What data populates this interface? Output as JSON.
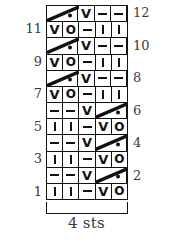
{
  "figure": {
    "kind": "knitting-stitch-chart",
    "stitch_count_caption": "4 sts",
    "columns": 5,
    "rows": 12,
    "ink_color": "#111111",
    "background_color": "#ffffff"
  },
  "row_labels_left": [
    "11",
    "9",
    "7",
    "5",
    "3",
    "1"
  ],
  "row_labels_right": [
    "12",
    "10",
    "8",
    "6",
    "4",
    "2"
  ],
  "symbol_legend": {
    "dash": "purl-stitch-dash",
    "bar": "knit-stitch-bar",
    "v": "slip-stitch-v",
    "o": "yarn-over-circle",
    "diagonal": "travel-line",
    "dot": "bobble-dot"
  },
  "chart_data": {
    "type": "table",
    "title": "",
    "xlabel": "4 sts",
    "ylabel": "",
    "columns": 5,
    "rows": 12,
    "row_order": "bottom-to-top",
    "rows_data": [
      {
        "row": 1,
        "label": "1",
        "label_side": "left",
        "cells": [
          "bar",
          "bar",
          "dash",
          "v",
          "o"
        ]
      },
      {
        "row": 2,
        "label": "2",
        "label_side": "right",
        "cells": [
          "dash",
          "dash",
          "v",
          "diagonal-right-start",
          "diagonal-right-end-dot"
        ]
      },
      {
        "row": 3,
        "label": "3",
        "label_side": "left",
        "cells": [
          "bar",
          "bar",
          "dash",
          "v",
          "o"
        ]
      },
      {
        "row": 4,
        "label": "4",
        "label_side": "right",
        "cells": [
          "dash",
          "dash",
          "v",
          "diagonal-right-start",
          "diagonal-right-end-dot"
        ]
      },
      {
        "row": 5,
        "label": "5",
        "label_side": "left",
        "cells": [
          "bar",
          "bar",
          "dash",
          "v",
          "o"
        ]
      },
      {
        "row": 6,
        "label": "6",
        "label_side": "right",
        "cells": [
          "dash",
          "dash",
          "v",
          "diagonal-right-start",
          "diagonal-right-end-dot"
        ]
      },
      {
        "row": 7,
        "label": "7",
        "label_side": "left",
        "cells": [
          "v",
          "o",
          "dash",
          "bar",
          "bar"
        ]
      },
      {
        "row": 8,
        "label": "8",
        "label_side": "right",
        "cells": [
          "diagonal-left-start",
          "diagonal-left-end-dot",
          "v",
          "dash",
          "dash"
        ]
      },
      {
        "row": 9,
        "label": "9",
        "label_side": "left",
        "cells": [
          "v",
          "o",
          "dash",
          "bar",
          "bar"
        ]
      },
      {
        "row": 10,
        "label": "10",
        "label_side": "right",
        "cells": [
          "diagonal-left-start",
          "diagonal-left-end-dot",
          "v",
          "dash",
          "dash"
        ]
      },
      {
        "row": 11,
        "label": "11",
        "label_side": "left",
        "cells": [
          "v",
          "o",
          "dash",
          "bar",
          "bar"
        ]
      },
      {
        "row": 12,
        "label": "12",
        "label_side": "right",
        "cells": [
          "diagonal-left-start",
          "diagonal-left-end-dot",
          "v",
          "dash",
          "dash"
        ]
      }
    ]
  },
  "glyphs": {
    "v": "V",
    "o": "O"
  }
}
